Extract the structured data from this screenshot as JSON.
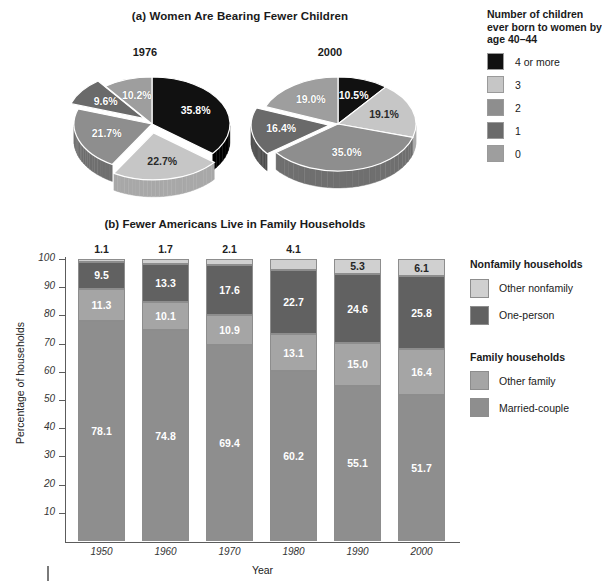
{
  "panel_a": {
    "title": "(a) Women Are Bearing Fewer Children",
    "pies": [
      {
        "year": "1976",
        "slices": [
          {
            "label": "4 or more",
            "value": 35.8,
            "text": "35.8%",
            "color": "#111111",
            "side": "#000000",
            "exploded": false,
            "light_text": true
          },
          {
            "label": "3",
            "value": 22.7,
            "text": "22.7%",
            "color": "#c6c6c6",
            "side": "#a8a8a8",
            "exploded": true,
            "light_text": false
          },
          {
            "label": "2",
            "value": 21.7,
            "text": "21.7%",
            "color": "#8e8e8e",
            "side": "#6f6f6f",
            "exploded": false,
            "light_text": true
          },
          {
            "label": "1",
            "value": 9.6,
            "text": "9.6%",
            "color": "#6a6a6a",
            "side": "#4e4e4e",
            "exploded": true,
            "light_text": true
          },
          {
            "label": "0",
            "value": 10.2,
            "text": "10.2%",
            "color": "#9e9e9e",
            "side": "#808080",
            "exploded": false,
            "light_text": true
          }
        ]
      },
      {
        "year": "2000",
        "slices": [
          {
            "label": "4 or more",
            "value": 10.5,
            "text": "10.5%",
            "color": "#111111",
            "side": "#000000",
            "exploded": false,
            "light_text": true
          },
          {
            "label": "3",
            "value": 19.1,
            "text": "19.1%",
            "color": "#c6c6c6",
            "side": "#a8a8a8",
            "exploded": false,
            "light_text": false
          },
          {
            "label": "2",
            "value": 35.0,
            "text": "35.0%",
            "color": "#8e8e8e",
            "side": "#6f6f6f",
            "exploded": false,
            "light_text": true
          },
          {
            "label": "1",
            "value": 16.4,
            "text": "16.4%",
            "color": "#6a6a6a",
            "side": "#4e4e4e",
            "exploded": true,
            "light_text": true
          },
          {
            "label": "0",
            "value": 19.0,
            "text": "19.0%",
            "color": "#9e9e9e",
            "side": "#808080",
            "exploded": false,
            "light_text": true
          }
        ]
      }
    ],
    "legend": {
      "title": "Number of children ever born to women by age 40–44",
      "items": [
        {
          "label": "4 or more",
          "color": "#111111"
        },
        {
          "label": "3",
          "color": "#c6c6c6"
        },
        {
          "label": "2",
          "color": "#8e8e8e"
        },
        {
          "label": "1",
          "color": "#6a6a6a"
        },
        {
          "label": "0",
          "color": "#9e9e9e"
        }
      ]
    }
  },
  "panel_b": {
    "title": "(b) Fewer Americans Live in Family Households",
    "legend": {
      "group_nonfamily": "Nonfamily households",
      "group_family": "Family households",
      "items": [
        {
          "label": "Other nonfamily",
          "color": "#d0d0d0",
          "group": "nonfamily"
        },
        {
          "label": "One-person",
          "color": "#616161",
          "group": "nonfamily"
        },
        {
          "label": "Other family",
          "color": "#a5a5a5",
          "group": "family"
        },
        {
          "label": "Married-couple",
          "color": "#8e8e8e",
          "group": "family"
        }
      ]
    }
  },
  "chart_data": [
    {
      "type": "pie",
      "title": "(a) Women Are Bearing Fewer Children",
      "subtitle": "Number of children ever born to women by age 40–44",
      "legend_position": "right",
      "charts": [
        {
          "name": "1976",
          "labels": [
            "4 or more",
            "3",
            "2",
            "1",
            "0"
          ],
          "values": [
            35.8,
            22.7,
            21.7,
            9.6,
            10.2
          ]
        },
        {
          "name": "2000",
          "labels": [
            "4 or more",
            "3",
            "2",
            "1",
            "0"
          ],
          "values": [
            10.5,
            19.1,
            35.0,
            16.4,
            19.0
          ]
        }
      ]
    },
    {
      "type": "bar",
      "subtype": "stacked-100",
      "title": "(b) Fewer Americans Live in Family Households",
      "xlabel": "Year",
      "ylabel": "Percentage of households",
      "ylim": [
        0,
        100
      ],
      "yticks": [
        10,
        20,
        30,
        40,
        50,
        60,
        70,
        80,
        90,
        100
      ],
      "grid": false,
      "legend_position": "right",
      "categories": [
        "1950",
        "1960",
        "1970",
        "1980",
        "1990",
        "2000"
      ],
      "series": [
        {
          "name": "Married-couple",
          "color": "#8e8e8e",
          "values": [
            78.1,
            74.8,
            69.4,
            60.2,
            55.1,
            51.7
          ]
        },
        {
          "name": "Other family",
          "color": "#a5a5a5",
          "values": [
            11.3,
            10.1,
            10.9,
            13.1,
            15.0,
            16.4
          ]
        },
        {
          "name": "One-person",
          "color": "#616161",
          "values": [
            9.5,
            13.3,
            17.6,
            22.7,
            24.6,
            25.8
          ]
        },
        {
          "name": "Other nonfamily",
          "color": "#d0d0d0",
          "values": [
            1.1,
            1.7,
            2.1,
            4.1,
            5.3,
            6.1
          ]
        }
      ]
    }
  ]
}
